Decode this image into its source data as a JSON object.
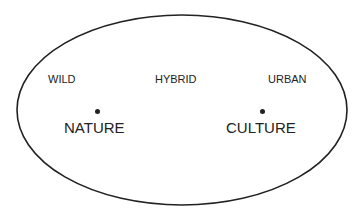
{
  "diagram": {
    "shape": "ellipse",
    "stroke_color": "#222222",
    "spectrum_labels": [
      "WILD",
      "HYBRID",
      "URBAN"
    ],
    "poles": [
      {
        "label": "NATURE"
      },
      {
        "label": "CULTURE"
      }
    ]
  }
}
